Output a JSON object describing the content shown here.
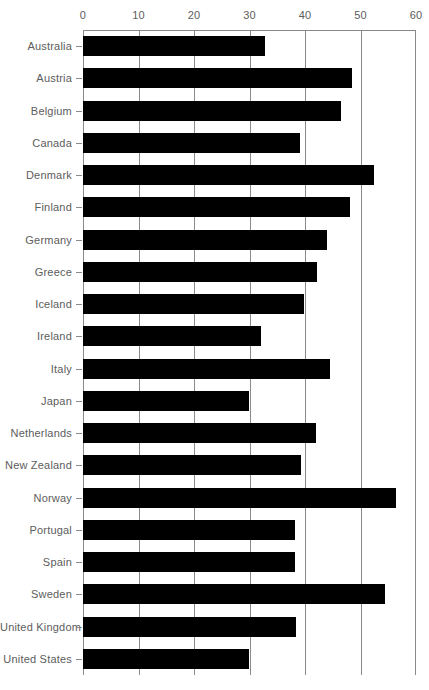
{
  "chart_data": {
    "type": "bar",
    "orientation": "horizontal",
    "title": "",
    "subtitle": "",
    "xlabel": "",
    "ylabel": "",
    "xlim": [
      0,
      60
    ],
    "ylim": null,
    "grid": true,
    "legend": null,
    "legend_position": "none",
    "xticks": [
      0,
      10,
      20,
      30,
      40,
      50,
      60
    ],
    "xtick_labels": [
      "0",
      "10",
      "20",
      "30",
      "40",
      "50",
      "60"
    ],
    "bar_color": "#000000",
    "axis_color": "#8a8a8a",
    "label_color": "#5d5d5d",
    "categories": [
      "Australia",
      "Austria",
      "Belgium",
      "Canada",
      "Denmark",
      "Finland",
      "Germany",
      "Greece",
      "Iceland",
      "Ireland",
      "Italy",
      "Japan",
      "Netherlands",
      "New Zealand",
      "Norway",
      "Portugal",
      "Spain",
      "Sweden",
      "United Kingdom",
      "United States"
    ],
    "values": [
      32.8,
      48.5,
      46.5,
      39.1,
      52.4,
      48.1,
      43.9,
      42.2,
      39.8,
      32.1,
      44.5,
      29.9,
      42.0,
      39.3,
      56.4,
      38.2,
      38.2,
      54.4,
      38.4,
      29.9
    ]
  }
}
